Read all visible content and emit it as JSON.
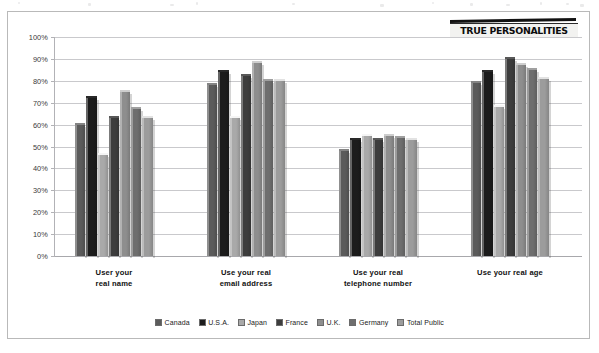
{
  "watermark": {
    "label": "TRUE PERSONALITIES"
  },
  "axis": {
    "y_ticks": [
      "100%",
      "90%",
      "80%",
      "70%",
      "60%",
      "50%",
      "40%",
      "30%",
      "20%",
      "10%",
      "0%"
    ]
  },
  "legend": {
    "items": [
      {
        "label": "Canada",
        "color": "#5b5b5b"
      },
      {
        "label": "U.S.A.",
        "color": "#1c1c1c"
      },
      {
        "label": "Japan",
        "color": "#a9a9a9"
      },
      {
        "label": "France",
        "color": "#3d3d3d"
      },
      {
        "label": "U.K.",
        "color": "#8e8e8e"
      },
      {
        "label": "Germany",
        "color": "#6e6e6e"
      },
      {
        "label": "Total Public",
        "color": "#9c9c9c"
      }
    ]
  },
  "chart_data": {
    "type": "bar",
    "title": "",
    "xlabel": "",
    "ylabel": "",
    "ylim": [
      0,
      100
    ],
    "grid": true,
    "legend_position": "bottom",
    "categories": [
      "User your\nreal name",
      "Use your real\nemail address",
      "Use your real\ntelephone number",
      "Use your real age"
    ],
    "categories_display": [
      [
        "User your",
        "real name"
      ],
      [
        "Use your real",
        "email address"
      ],
      [
        "Use your real",
        "telephone number"
      ],
      [
        "Use your real age"
      ]
    ],
    "series": [
      {
        "name": "Canada",
        "color": "#5b5b5b",
        "values": [
          60,
          78,
          48,
          79
        ]
      },
      {
        "name": "U.S.A.",
        "color": "#1c1c1c",
        "values": [
          72,
          84,
          53,
          84
        ]
      },
      {
        "name": "Japan",
        "color": "#a9a9a9",
        "values": [
          46,
          63,
          55,
          68
        ]
      },
      {
        "name": "France",
        "color": "#3d3d3d",
        "values": [
          63,
          82,
          53,
          90
        ]
      },
      {
        "name": "U.K.",
        "color": "#8e8e8e",
        "values": [
          75,
          88,
          55,
          87
        ]
      },
      {
        "name": "Germany",
        "color": "#6e6e6e",
        "values": [
          67,
          80,
          54,
          85
        ]
      },
      {
        "name": "Total Public",
        "color": "#9c9c9c",
        "values": [
          63,
          80,
          53,
          81
        ]
      }
    ]
  }
}
